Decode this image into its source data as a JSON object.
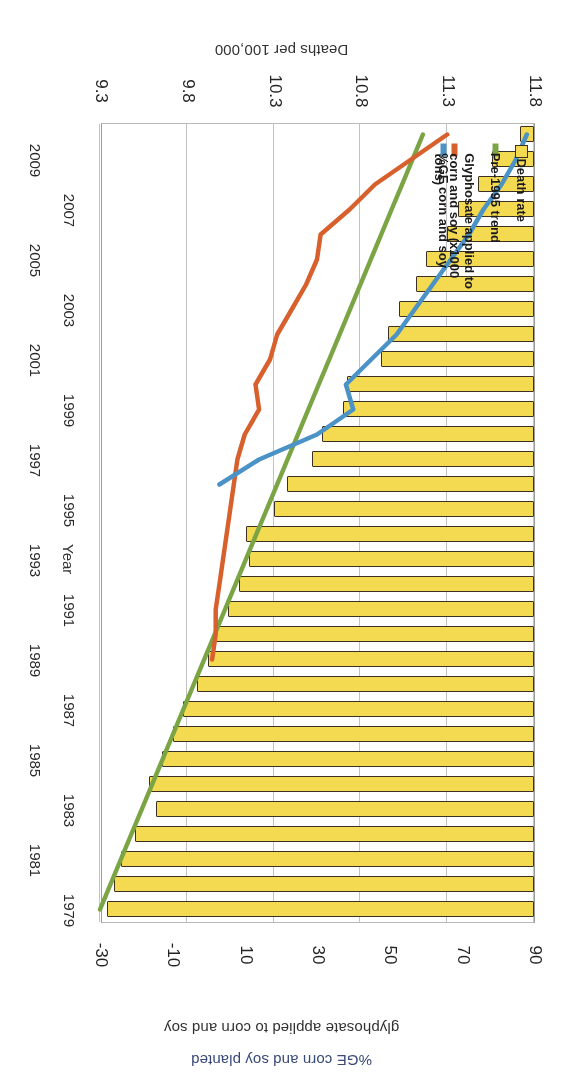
{
  "chart_data": {
    "type": "bar",
    "orientation": "horizontal",
    "title": "",
    "xlabel": "Deaths per 100,000",
    "ylabel": "Year",
    "secondary_axis_label_line1": "glyphosate applied to corn and soy",
    "secondary_axis_label_line2": "%GE corn and soy planted",
    "rotation_note": "image is scanned upside-down (180 degrees)",
    "primary_axis": {
      "name": "Deaths per 100,000",
      "ticks": [
        "9.3",
        "9.8",
        "10.3",
        "10.8",
        "11.3",
        "11.8"
      ],
      "lim": [
        9.3,
        11.8
      ]
    },
    "secondary_axis": {
      "name": "%GE corn and soy planted / glyphosate applied to corn and soy",
      "ticks": [
        "-30",
        "-10",
        "10",
        "30",
        "50",
        "70",
        "90"
      ],
      "lim": [
        -30,
        90
      ]
    },
    "categories": [
      "1979",
      "1980",
      "1981",
      "1982",
      "1983",
      "1984",
      "1985",
      "1986",
      "1987",
      "1988",
      "1989",
      "1990",
      "1991",
      "1992",
      "1993",
      "1994",
      "1995",
      "1996",
      "1997",
      "1998",
      "1999",
      "2000",
      "2001",
      "2002",
      "2003",
      "2004",
      "2005",
      "2006",
      "2007",
      "2008",
      "2009",
      "2010"
    ],
    "category_tick_labels": [
      "1979",
      "1981",
      "1983",
      "1985",
      "1987",
      "1989",
      "1991",
      "1993",
      "1995",
      "1997",
      "1999",
      "2001",
      "2003",
      "2005",
      "2007",
      "2009"
    ],
    "grid": true,
    "legend_position": "bottom-left",
    "series": [
      {
        "name": "Death rate",
        "type": "bar",
        "color": "#f2d84c",
        "edge_color": "#3d3222",
        "axis": "primary",
        "values": [
          9.34,
          9.38,
          9.42,
          9.5,
          9.62,
          9.58,
          9.66,
          9.72,
          9.78,
          9.86,
          9.92,
          9.96,
          10.04,
          10.1,
          10.16,
          10.14,
          10.3,
          10.38,
          10.52,
          10.58,
          10.7,
          10.72,
          10.92,
          10.96,
          11.02,
          11.12,
          11.18,
          11.3,
          11.36,
          11.48,
          11.56,
          11.72
        ]
      },
      {
        "name": "Pre-1995 trend",
        "type": "line",
        "color": "#7aa543",
        "axis": "primary",
        "x": [
          "1979",
          "1980",
          "1981",
          "1982",
          "1983",
          "1984",
          "1985",
          "1986",
          "1987",
          "1988",
          "1989",
          "1990",
          "1991",
          "1992",
          "1993",
          "1994",
          "1995",
          "1996",
          "1997",
          "1998",
          "1999",
          "2000",
          "2001",
          "2002",
          "2003",
          "2004",
          "2005",
          "2006",
          "2007",
          "2008",
          "2009",
          "2010"
        ],
        "values": [
          9.3,
          9.36,
          9.42,
          9.48,
          9.54,
          9.6,
          9.66,
          9.72,
          9.78,
          9.84,
          9.9,
          9.96,
          10.02,
          10.08,
          10.14,
          10.2,
          10.26,
          10.32,
          10.38,
          10.44,
          10.5,
          10.56,
          10.62,
          10.68,
          10.74,
          10.8,
          10.86,
          10.92,
          10.98,
          11.04,
          11.1,
          11.16
        ]
      },
      {
        "name": "Glyphosate applied to corn and soy (x1000 tons)",
        "type": "line",
        "color": "#d9602c",
        "axis": "secondary",
        "x": [
          "1989",
          "1990",
          "1991",
          "1992",
          "1993",
          "1994",
          "1995",
          "1996",
          "1997",
          "1998",
          "1999",
          "2000",
          "2001",
          "2002",
          "2003",
          "2004",
          "2005",
          "2006",
          "2007",
          "2008",
          "2009",
          "2010"
        ],
        "values": [
          1,
          2,
          2,
          3,
          4,
          5,
          6,
          7,
          8,
          10,
          14,
          13,
          17,
          19,
          23,
          27,
          30,
          31,
          39,
          46,
          56,
          66
        ]
      },
      {
        "name": "%GE corn and soy",
        "type": "line",
        "color": "#4a92c8",
        "axis": "secondary",
        "x": [
          "1996",
          "1997",
          "1998",
          "1999",
          "2000",
          "2001",
          "2002",
          "2003",
          "2004",
          "2005",
          "2006",
          "2007",
          "2008",
          "2009",
          "2010"
        ],
        "values": [
          3,
          14,
          30,
          40,
          38,
          45,
          52,
          57,
          62,
          67,
          72,
          76,
          81,
          85,
          88
        ]
      }
    ]
  },
  "axis_titles": {
    "primary": "Deaths per 100,000",
    "category": "Year",
    "secondary_line1": "glyphosate applied to corn and soy",
    "secondary_line2": "%GE corn and soy planted"
  },
  "legend": {
    "items": [
      {
        "label": "Death rate",
        "marker": "box",
        "color": "#f2d84c"
      },
      {
        "label": "Pre-1995 trend",
        "marker": "line",
        "color": "#7aa543"
      },
      {
        "label": "Glyphosate applied to\ncorn and soy (x1000\ntons)",
        "marker": "line",
        "color": "#d9602c"
      },
      {
        "label": "%GE corn and soy",
        "marker": "line",
        "color": "#4a92c8"
      }
    ]
  },
  "colors": {
    "bar_fill": "#f2d84c",
    "bar_edge": "#3d3222",
    "trend": "#7aa543",
    "glyphosate": "#d9602c",
    "ge": "#4a92c8",
    "grid": "#cfcfcf",
    "text": "#262626",
    "secondary_label": "#3a4a7a"
  }
}
